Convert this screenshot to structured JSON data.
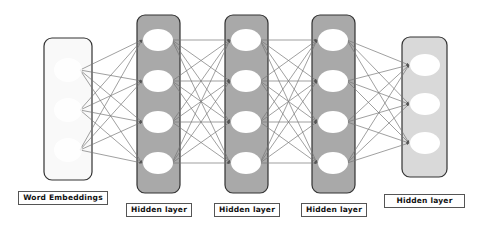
{
  "colors": {
    "hidden_fill": "#a9a9a9",
    "output_fill": "#d9d9d9",
    "input_fill": "#f9f9f9",
    "node_fill": "#ffffff",
    "box_stroke": "#333333",
    "edge": "#777777"
  },
  "layers": [
    {
      "id": "word-embeddings",
      "label": "Word Embeddings",
      "type": "input",
      "box": {
        "x": 44,
        "y": 38,
        "w": 48,
        "h": 142
      },
      "node_x": 68,
      "edge_x": 80,
      "nodes_y": [
        70,
        110,
        150
      ],
      "label_box": {
        "x": 18,
        "y": 191,
        "w": 90
      }
    },
    {
      "id": "hidden-layer-1",
      "label": "Hidden layer",
      "type": "hidden",
      "box": {
        "x": 137,
        "y": 15,
        "w": 43,
        "h": 178
      },
      "node_x": 158,
      "nodes_y": [
        40,
        81,
        122,
        163
      ],
      "label_box": {
        "x": 126,
        "y": 203,
        "w": 66
      }
    },
    {
      "id": "hidden-layer-2",
      "label": "Hidden layer",
      "type": "hidden",
      "box": {
        "x": 225,
        "y": 15,
        "w": 43,
        "h": 178
      },
      "node_x": 246,
      "nodes_y": [
        40,
        81,
        122,
        163
      ],
      "label_box": {
        "x": 214,
        "y": 203,
        "w": 66
      }
    },
    {
      "id": "hidden-layer-3",
      "label": "Hidden layer",
      "type": "hidden",
      "box": {
        "x": 312,
        "y": 15,
        "w": 43,
        "h": 178
      },
      "node_x": 333,
      "nodes_y": [
        40,
        81,
        122,
        163
      ],
      "label_box": {
        "x": 301,
        "y": 203,
        "w": 66
      }
    },
    {
      "id": "hidden-layer-4",
      "label": "Hidden layer",
      "type": "output",
      "box": {
        "x": 402,
        "y": 37,
        "w": 45,
        "h": 140
      },
      "node_x": 425,
      "nodes_y": [
        65,
        104,
        143
      ],
      "label_box": {
        "x": 384,
        "y": 194,
        "w": 81
      }
    }
  ]
}
